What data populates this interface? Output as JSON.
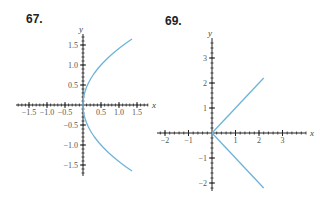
{
  "problems": [
    {
      "number": "67."
    },
    {
      "number": "69."
    }
  ],
  "colors": {
    "curve": "#6fb3d9",
    "axis": "#222222"
  },
  "chart_data": [
    {
      "type": "line",
      "title": "67.",
      "xlabel": "x",
      "ylabel": "y",
      "xlim": [
        -1.75,
        1.75
      ],
      "ylim": [
        -1.75,
        1.75
      ],
      "xticks": [
        "-1.5",
        "-1.0",
        "-0.5",
        "0.5",
        "1.0",
        "1.5"
      ],
      "yticks": [
        "1.5",
        "1.0",
        "0.5",
        "-0.5",
        "-1.0",
        "-1.5"
      ],
      "series": [
        {
          "name": "curve",
          "description": "sideways parabola opening right, x = y^2/2",
          "x": [
            1.36,
            1.0,
            0.61,
            0.32,
            0.125,
            0.02,
            0,
            0.02,
            0.125,
            0.32,
            0.61,
            1.0,
            1.36
          ],
          "y": [
            1.65,
            1.41,
            1.1,
            0.8,
            0.5,
            0.2,
            0,
            -0.2,
            -0.5,
            -0.8,
            -1.1,
            -1.41,
            -1.65
          ]
        }
      ],
      "grid": false
    },
    {
      "type": "line",
      "title": "69.",
      "xlabel": "x",
      "ylabel": "y",
      "xlim": [
        -2.1,
        3.9
      ],
      "ylim": [
        -2.3,
        4
      ],
      "xticks": [
        "-2",
        "-1",
        "1",
        "2",
        "3"
      ],
      "yticks": [
        "3",
        "2",
        "1",
        "-1",
        "-2"
      ],
      "series": [
        {
          "name": "upper ray",
          "x": [
            0,
            2.2
          ],
          "y": [
            0,
            2.2
          ]
        },
        {
          "name": "lower ray",
          "x": [
            0,
            2.2
          ],
          "y": [
            0,
            -2.2
          ]
        }
      ],
      "grid": false
    }
  ]
}
